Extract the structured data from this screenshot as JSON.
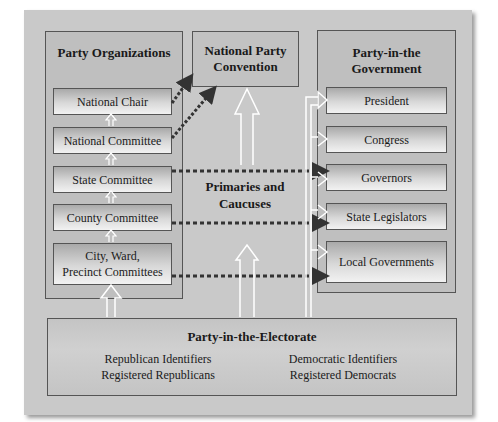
{
  "diagram": {
    "party_organizations": {
      "title": "Party Organizations",
      "items": [
        "National Chair",
        "National Committee",
        "State Committee",
        "County Committee",
        "City, Ward,\nPrecinct Committees"
      ]
    },
    "national_convention": {
      "line1": "National Party",
      "line2": "Convention"
    },
    "primaries": {
      "line1": "Primaries and",
      "line2": "Caucuses"
    },
    "party_in_government": {
      "title_line1": "Party-in-the",
      "title_line2": "Government",
      "items": [
        "President",
        "Congress",
        "Governors",
        "State Legislators",
        "Local Governments"
      ]
    },
    "party_in_electorate": {
      "title": "Party-in-the-Electorate",
      "left": [
        "Republican Identifiers",
        "Registered Republicans"
      ],
      "right": [
        "Democratic Identifiers",
        "Registered Democrats"
      ]
    },
    "colors": {
      "frame": "#c9c9c9",
      "panel": "#bfbfbf",
      "border": "#555555",
      "dotted_arrow": "#333333",
      "hollow_arrow": "#ffffff"
    }
  }
}
